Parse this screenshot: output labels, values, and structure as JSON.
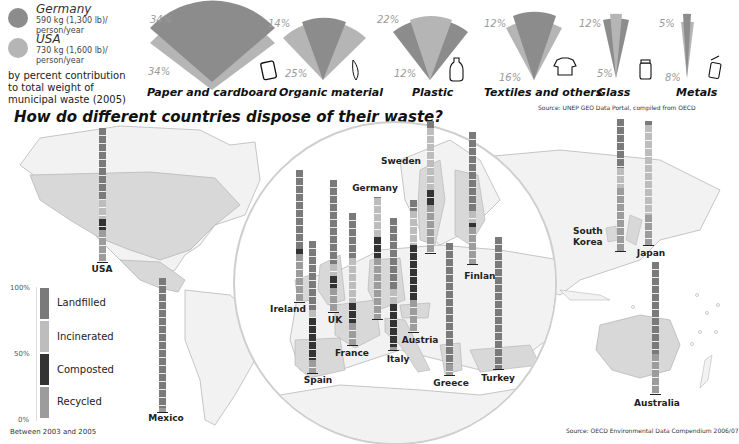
{
  "colors": {
    "germany": "#8c8c8c",
    "usa": "#b5b5b5",
    "landfilled": "#7a7a7a",
    "incinerated": "#bdbdbd",
    "composted": "#333333",
    "recycled": "#9c9c9c",
    "land": "#e2e2e2",
    "land_highlight": "#cfcfcf"
  },
  "top_legend": {
    "germany": {
      "name": "Germany",
      "detail": "590 kg (1,300 lb)/ person/year"
    },
    "usa": {
      "name": "USA",
      "detail": "730 kg (1,600 lb)/ person/year"
    },
    "note": "by percent contribution to total weight of municipal waste (2005)"
  },
  "top_source": "Source:  UNEP GEO Data Portal, compiled from OECD",
  "main_title": "How do different countries dispose of their waste?",
  "bottom_legend": {
    "ticks": [
      "100%",
      "50%",
      "0%"
    ],
    "items": [
      "Landfilled",
      "Incinerated",
      "Composted",
      "Recycled"
    ],
    "footnote": "Between 2003 and 2005"
  },
  "bottom_source": "Source: OECD Environmental Data Compendium 2006/07",
  "chart_data": [
    {
      "type": "pie",
      "title": "Waste composition by type",
      "subtitle": "by percent contribution to total weight of municipal waste (2005)",
      "legend": [
        "Germany",
        "USA"
      ],
      "categories": [
        "Paper and cardboard",
        "Organic material",
        "Plastic",
        "Textiles and others",
        "Glass",
        "Metals"
      ],
      "series": [
        {
          "name": "Germany",
          "values": [
            34,
            14,
            22,
            12,
            12,
            5
          ]
        },
        {
          "name": "USA",
          "values": [
            34,
            25,
            12,
            16,
            5,
            8
          ]
        }
      ]
    },
    {
      "type": "bar",
      "stacked": true,
      "title": "How do different countries dispose of their waste?",
      "ylabel": "percent",
      "ylim": [
        0,
        100
      ],
      "yticks": [
        "0%",
        "50%",
        "100%"
      ],
      "note": "Between 2003 and 2005",
      "categories": [
        "USA",
        "Mexico",
        "Ireland",
        "Spain",
        "UK",
        "France",
        "Germany",
        "Italy",
        "Austria",
        "Sweden",
        "Finland",
        "Greece",
        "Turkey",
        "South Korea",
        "Japan",
        "Australia"
      ],
      "series": [
        {
          "name": "Landfilled",
          "values": [
            54,
            97,
            60,
            52,
            64,
            34,
            1,
            54,
            8,
            5,
            60,
            92,
            100,
            37,
            3,
            70
          ]
        },
        {
          "name": "Incinerated",
          "values": [
            14,
            0,
            0,
            6,
            9,
            34,
            32,
            11,
            26,
            47,
            9,
            0,
            0,
            15,
            73,
            0
          ]
        },
        {
          "name": "Composted",
          "values": [
            8,
            0,
            4,
            32,
            9,
            15,
            17,
            33,
            42,
            12,
            3,
            0,
            0,
            0,
            0,
            0
          ]
        },
        {
          "name": "Recycled",
          "values": [
            24,
            3,
            36,
            10,
            18,
            17,
            50,
            2,
            24,
            36,
            28,
            8,
            0,
            48,
            24,
            30
          ]
        }
      ]
    }
  ],
  "fans": [
    {
      "label": "Paper and cardboard",
      "germany_pct": "34%",
      "usa_pct": "34%",
      "icon": "notebook-icon"
    },
    {
      "label": "Organic material",
      "germany_pct": "14%",
      "usa_pct": "25%",
      "icon": "banana-icon"
    },
    {
      "label": "Plastic",
      "germany_pct": "22%",
      "usa_pct": "12%",
      "icon": "bottle-icon"
    },
    {
      "label": "Textiles and others",
      "germany_pct": "12%",
      "usa_pct": "16%",
      "icon": "tshirt-icon"
    },
    {
      "label": "Glass",
      "germany_pct": "12%",
      "usa_pct": "5%",
      "icon": "jar-icon"
    },
    {
      "label": "Metals",
      "germany_pct": "5%",
      "usa_pct": "8%",
      "icon": "can-icon"
    }
  ],
  "countries": [
    {
      "name": "USA",
      "x": 102,
      "top": 128,
      "bottom": 262,
      "lx": 102,
      "ly": 264
    },
    {
      "name": "Mexico",
      "x": 162,
      "top": 278,
      "bottom": 412,
      "lx": 166,
      "ly": 413
    },
    {
      "name": "Ireland",
      "x": 299,
      "top": 170,
      "bottom": 302,
      "lx": 288,
      "ly": 304
    },
    {
      "name": "Spain",
      "x": 312,
      "top": 241,
      "bottom": 373,
      "lx": 318,
      "ly": 375
    },
    {
      "name": "UK",
      "x": 333,
      "top": 180,
      "bottom": 312,
      "lx": 335,
      "ly": 315
    },
    {
      "name": "France",
      "x": 352,
      "top": 213,
      "bottom": 345,
      "lx": 352,
      "ly": 348
    },
    {
      "name": "Germany",
      "x": 377,
      "top": 197,
      "bottom": 319,
      "lx": 375,
      "ly": 183
    },
    {
      "name": "Italy",
      "x": 393,
      "top": 218,
      "bottom": 350,
      "lx": 398,
      "ly": 354
    },
    {
      "name": "Austria",
      "x": 413,
      "top": 200,
      "bottom": 332,
      "lx": 420,
      "ly": 335
    },
    {
      "name": "Sweden",
      "x": 430,
      "top": 121,
      "bottom": 253,
      "lx": 401,
      "ly": 156
    },
    {
      "name": "Finland",
      "x": 472,
      "top": 132,
      "bottom": 264,
      "lx": 483,
      "ly": 271
    },
    {
      "name": "Greece",
      "x": 449,
      "top": 243,
      "bottom": 375,
      "lx": 451,
      "ly": 378
    },
    {
      "name": "Turkey",
      "x": 498,
      "top": 237,
      "bottom": 369,
      "lx": 498,
      "ly": 373
    },
    {
      "name": "South Korea",
      "x": 620,
      "top": 119,
      "bottom": 251,
      "lx": 590,
      "ly": 226
    },
    {
      "name": "Japan",
      "x": 648,
      "top": 121,
      "bottom": 245,
      "lx": 651,
      "ly": 248
    },
    {
      "name": "Australia",
      "x": 655,
      "top": 262,
      "bottom": 394,
      "lx": 657,
      "ly": 398
    }
  ]
}
